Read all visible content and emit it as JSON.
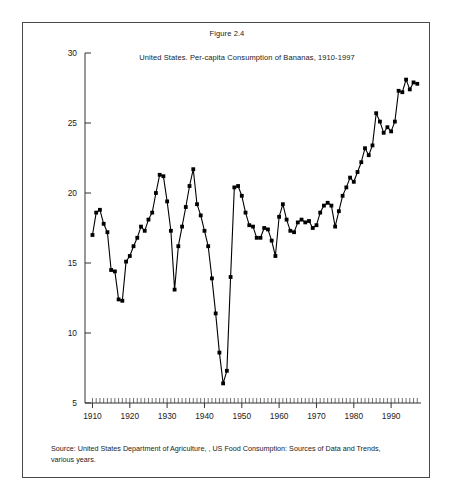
{
  "figure": {
    "title": "Figure 2.4",
    "source_note": "Source: United States Department of Agriculture, , US Food Consumption: Sources of Data and Trends, various years."
  },
  "chart_data": {
    "type": "line",
    "title": "United States. Per-capita Consumption of Bananas, 1910-1997",
    "xlabel": "",
    "ylabel": "",
    "xlim": [
      1908,
      1998
    ],
    "ylim": [
      5,
      30
    ],
    "ytick_values": [
      5,
      10,
      15,
      20,
      25,
      30
    ],
    "ytick_labels": [
      "5",
      "10",
      "15",
      "20",
      "25",
      "30"
    ],
    "xtick_values": [
      1910,
      1920,
      1930,
      1940,
      1950,
      1960,
      1970,
      1980,
      1990
    ],
    "xtick_labels": [
      "1910",
      "1920",
      "1930",
      "1940",
      "1950",
      "1960",
      "1970",
      "1980",
      "1990"
    ],
    "minor_xticks": true,
    "minor_xtick_step": 1,
    "grid": false,
    "legend": false,
    "marker": "square",
    "marker_color": "#000000",
    "line_color": "#000000",
    "x": [
      1910,
      1911,
      1912,
      1913,
      1914,
      1915,
      1916,
      1917,
      1918,
      1919,
      1920,
      1921,
      1922,
      1923,
      1924,
      1925,
      1926,
      1927,
      1928,
      1929,
      1930,
      1931,
      1932,
      1933,
      1934,
      1935,
      1936,
      1937,
      1938,
      1939,
      1940,
      1941,
      1942,
      1943,
      1944,
      1945,
      1946,
      1947,
      1948,
      1949,
      1950,
      1951,
      1952,
      1953,
      1954,
      1955,
      1956,
      1957,
      1958,
      1959,
      1960,
      1961,
      1962,
      1963,
      1964,
      1965,
      1966,
      1967,
      1968,
      1969,
      1970,
      1971,
      1972,
      1973,
      1974,
      1975,
      1976,
      1977,
      1978,
      1979,
      1980,
      1981,
      1982,
      1983,
      1984,
      1985,
      1986,
      1987,
      1988,
      1989,
      1990,
      1991,
      1992,
      1993,
      1994,
      1995,
      1996,
      1997
    ],
    "values": [
      17.0,
      18.6,
      18.8,
      17.8,
      17.2,
      14.5,
      14.4,
      12.4,
      12.3,
      15.1,
      15.5,
      16.2,
      16.8,
      17.6,
      17.3,
      18.1,
      18.6,
      20.0,
      21.3,
      21.2,
      19.4,
      17.3,
      13.1,
      16.2,
      17.6,
      19.0,
      20.5,
      21.7,
      19.2,
      18.4,
      17.3,
      16.2,
      13.9,
      11.4,
      8.6,
      6.4,
      7.3,
      14.0,
      20.4,
      20.5,
      19.8,
      18.6,
      17.7,
      17.6,
      16.8,
      16.8,
      17.5,
      17.4,
      16.6,
      15.5,
      18.3,
      19.2,
      18.1,
      17.3,
      17.2,
      17.9,
      18.1,
      17.9,
      18.0,
      17.5,
      17.7,
      18.6,
      19.1,
      19.3,
      19.1,
      17.6,
      18.7,
      19.8,
      20.4,
      21.1,
      20.8,
      21.5,
      22.2,
      23.2,
      22.7,
      23.4,
      25.7,
      25.1,
      24.3,
      24.7,
      24.4,
      25.1,
      27.3,
      27.2,
      28.1,
      27.4,
      27.9,
      27.8
    ]
  }
}
